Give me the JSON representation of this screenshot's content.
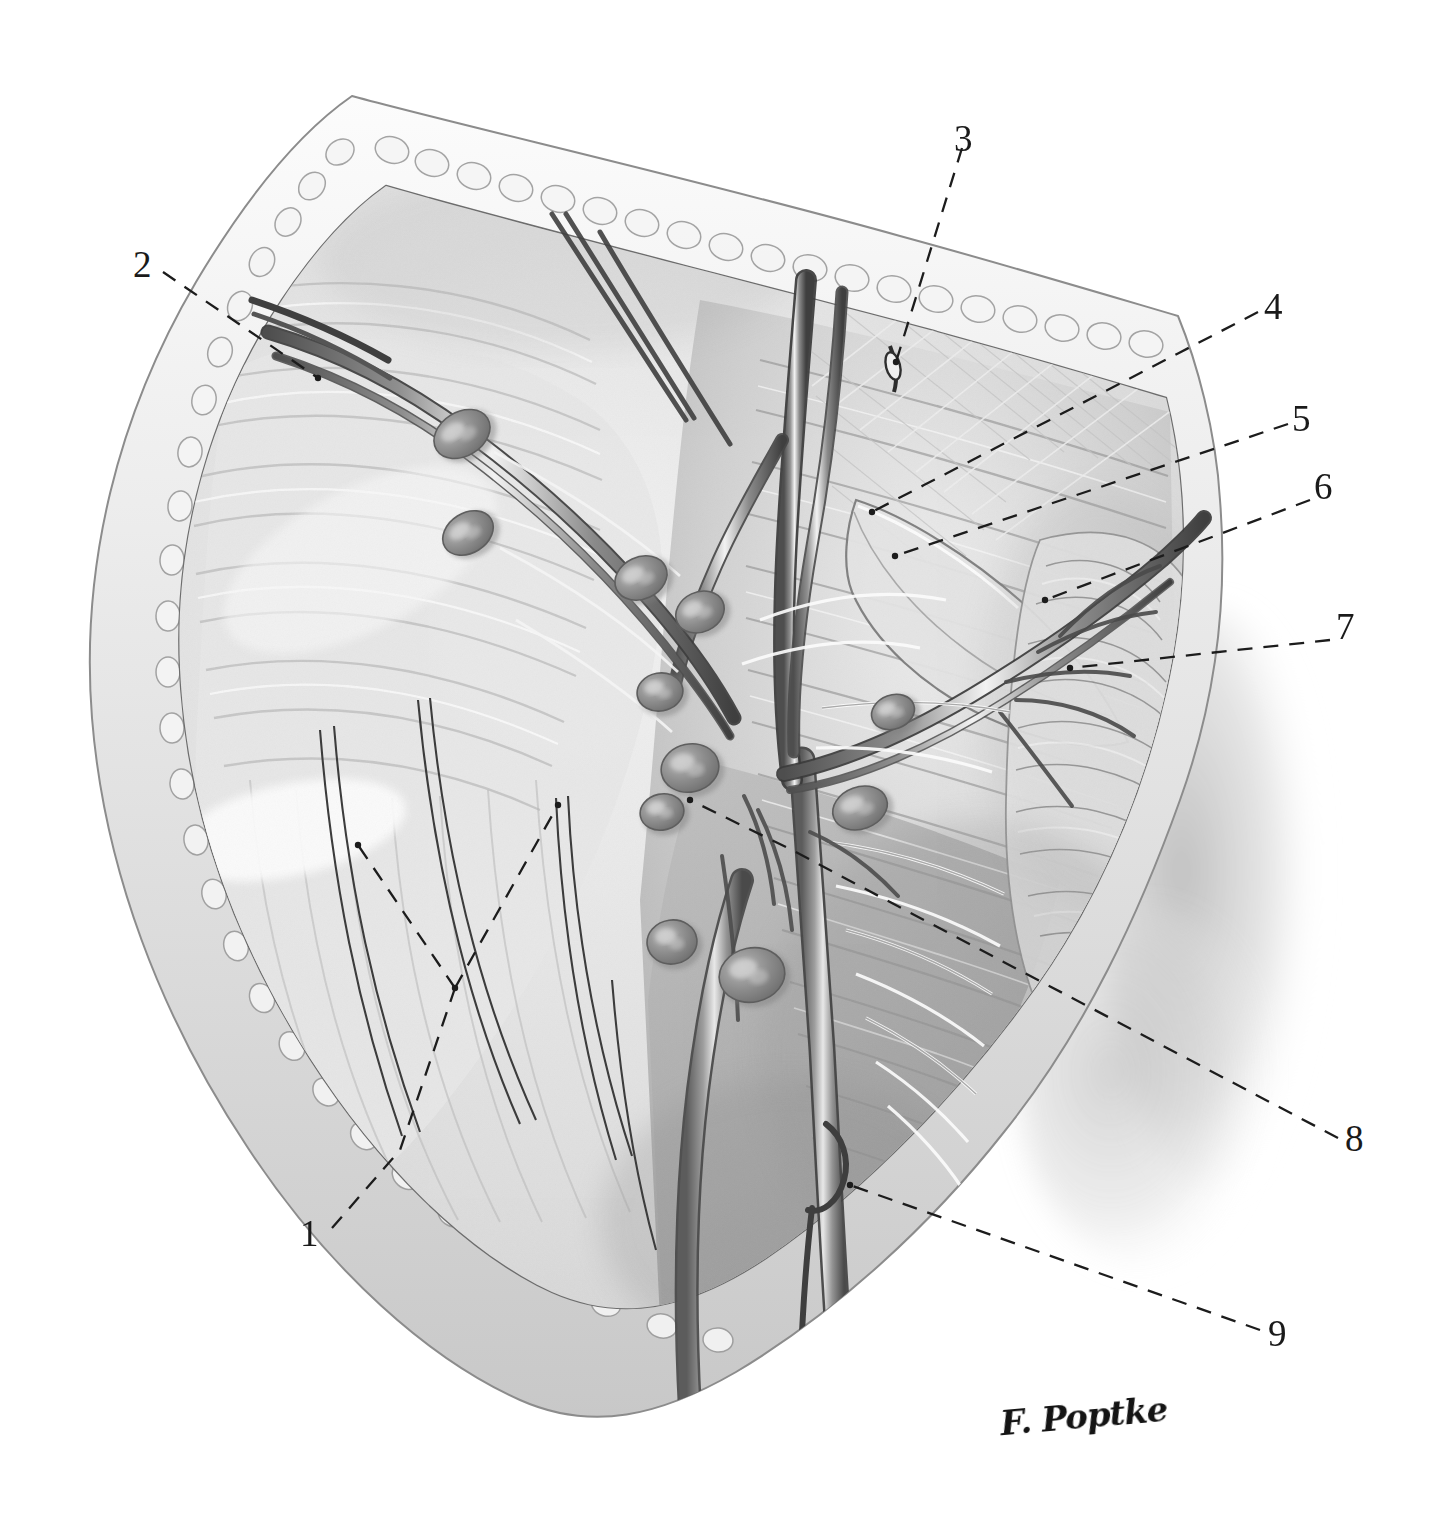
{
  "figure": {
    "kind": "anatomical-illustration",
    "background_color": "#ffffff",
    "ink_color": "#1a1a1a",
    "tissue_light": "#efefef",
    "tissue_mid": "#d4d4d4",
    "tissue_dark": "#a9a9a9",
    "tissue_deep": "#8a8a8a",
    "node_color": "#8e8e8e",
    "vessel_color": "#4a4a4a",
    "shadow_color": "#cccccc"
  },
  "labels": [
    {
      "id": "1",
      "text": "1",
      "x": 300,
      "y": 1215
    },
    {
      "id": "2",
      "text": "2",
      "x": 133,
      "y": 246
    },
    {
      "id": "3",
      "text": "3",
      "x": 954,
      "y": 120
    },
    {
      "id": "4",
      "text": "4",
      "x": 1264,
      "y": 288
    },
    {
      "id": "5",
      "text": "5",
      "x": 1292,
      "y": 400
    },
    {
      "id": "6",
      "text": "6",
      "x": 1314,
      "y": 468
    },
    {
      "id": "7",
      "text": "7",
      "x": 1336,
      "y": 608
    },
    {
      "id": "8",
      "text": "8",
      "x": 1345,
      "y": 1120
    },
    {
      "id": "9",
      "text": "9",
      "x": 1268,
      "y": 1315
    }
  ],
  "leader_lines": [
    {
      "for": "1",
      "points": "332,1228 400,1150 455,988"
    },
    {
      "for": "1",
      "points": "455,988 358,845"
    },
    {
      "for": "1",
      "points": "455,988 558,805"
    },
    {
      "for": "2",
      "points": "163,272 318,378"
    },
    {
      "for": "3",
      "points": "962,148 896,362"
    },
    {
      "for": "4",
      "points": "1258,312 872,512"
    },
    {
      "for": "5",
      "points": "1288,424 895,556"
    },
    {
      "for": "6",
      "points": "1310,500 1045,600"
    },
    {
      "for": "7",
      "points": "1330,640 1070,668"
    },
    {
      "for": "8",
      "points": "1338,1138 905,910 792,850 690,800"
    },
    {
      "for": "9",
      "points": "1260,1330 850,1185"
    }
  ],
  "signature": {
    "text": "F. Poptke",
    "x": 1000,
    "y": 1396
  },
  "lymph_nodes": [
    {
      "cx": 462,
      "cy": 434,
      "rx": 30,
      "ry": 22,
      "rot": -32
    },
    {
      "cx": 468,
      "cy": 533,
      "rx": 27,
      "ry": 20,
      "rot": -32
    },
    {
      "cx": 641,
      "cy": 578,
      "rx": 27,
      "ry": 21,
      "rot": -25
    },
    {
      "cx": 700,
      "cy": 612,
      "rx": 25,
      "ry": 20,
      "rot": -25
    },
    {
      "cx": 660,
      "cy": 692,
      "rx": 23,
      "ry": 19,
      "rot": -10
    },
    {
      "cx": 690,
      "cy": 768,
      "rx": 29,
      "ry": 24,
      "rot": -12
    },
    {
      "cx": 662,
      "cy": 812,
      "rx": 22,
      "ry": 18,
      "rot": -12
    },
    {
      "cx": 860,
      "cy": 808,
      "rx": 28,
      "ry": 21,
      "rot": -20
    },
    {
      "cx": 893,
      "cy": 712,
      "rx": 22,
      "ry": 17,
      "rot": -20
    },
    {
      "cx": 672,
      "cy": 942,
      "rx": 25,
      "ry": 22,
      "rot": -8
    },
    {
      "cx": 752,
      "cy": 975,
      "rx": 33,
      "ry": 27,
      "rot": -12
    }
  ]
}
